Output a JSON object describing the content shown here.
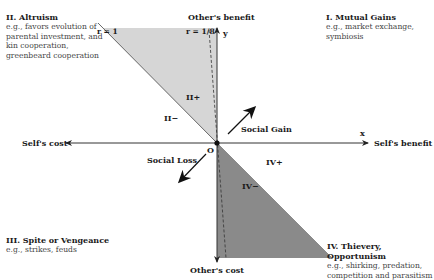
{
  "quadrants": {
    "q1": {
      "title": "I. Mutual Gains",
      "lines": [
        "e.g., market exchange,",
        "symbiosis"
      ]
    },
    "q2": {
      "title": "II. Altruism",
      "lines": [
        "e.g., favors evolution of",
        "parental investment, and",
        "kin cooperation,",
        "greenbeard cooperation"
      ]
    },
    "q3": {
      "title": "III. Spite or Vengeance",
      "lines": [
        "e.g., strikes, feuds"
      ]
    },
    "q4": {
      "title": "IV. Thievery, Opportunism",
      "lines": [
        "e.g., shirking, predation,",
        "competition and parasitism"
      ]
    }
  },
  "axes": {
    "x_pos_label": "Self's benefit",
    "x_neg_label": "Self's cost",
    "y_pos_label": "Other's benefit",
    "y_neg_label": "Other's cost",
    "x_symbol": "x",
    "y_symbol": "y",
    "origin": "O"
  },
  "lines": {
    "r1": "r = 1",
    "r18": "r = 1/8"
  },
  "regions": {
    "II_plus": "II+",
    "II_minus": "II−",
    "IV_plus": "IV+",
    "IV_minus": "IV−"
  },
  "arrows": {
    "social_gain": "Social Gain",
    "social_loss": "Social Loss"
  },
  "colors": {
    "light_region": "#d9d9d9",
    "dark_region": "#8c8c8c",
    "axis": "#333333"
  }
}
